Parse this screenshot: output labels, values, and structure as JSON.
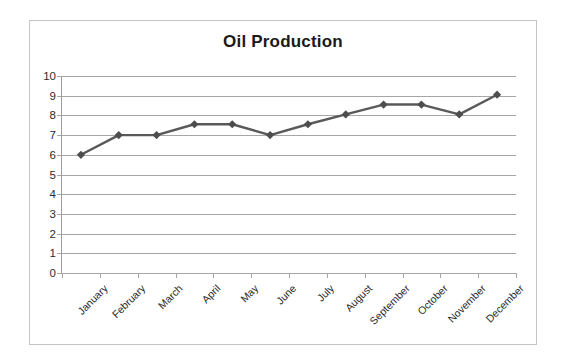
{
  "chart_data": {
    "type": "line",
    "title": "Oil Production",
    "xlabel": "",
    "ylabel": "",
    "categories": [
      "January",
      "February",
      "March",
      "April",
      "May",
      "June",
      "July",
      "August",
      "September",
      "October",
      "November",
      "December"
    ],
    "values": [
      6.0,
      7.0,
      7.0,
      7.55,
      7.55,
      7.0,
      7.55,
      8.05,
      8.55,
      8.55,
      8.05,
      9.05
    ],
    "series": [
      {
        "name": "Oil Production",
        "values": [
          6.0,
          7.0,
          7.0,
          7.55,
          7.55,
          7.0,
          7.55,
          8.05,
          8.55,
          8.55,
          8.05,
          9.05
        ]
      }
    ],
    "ylim": [
      0,
      10
    ],
    "y_ticks": [
      0,
      1,
      2,
      3,
      4,
      5,
      6,
      7,
      8,
      9,
      10
    ],
    "y_tick_labels": [
      "0",
      "1",
      "2",
      "3",
      "4",
      "5",
      "6",
      "7",
      "8",
      "9",
      "10"
    ],
    "grid": true,
    "grid_axis": "y",
    "legend": false,
    "legend_position": "none",
    "marker": "diamond",
    "x_label_rotation": -45,
    "colors": {
      "series_line": "#595959",
      "marker": "#4d4d4d",
      "gridline": "#a6a6a6",
      "axis": "#9e9e9e",
      "frame_border": "#c4c4c4",
      "title_text": "#1a1a1a",
      "tick_text": "#2b2b2b",
      "plot_background": "#ffffff",
      "page_background": "#ffffff"
    }
  }
}
